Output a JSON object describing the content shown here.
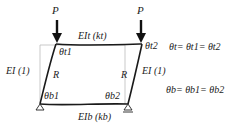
{
  "loads": {
    "left": "P",
    "right": "P"
  },
  "members": {
    "top_beam": "EIt (kt)",
    "bottom_beam": "EIb (kb)",
    "left_column": "EI (1)",
    "right_column": "EI (1)"
  },
  "rotation_labels": {
    "top_left": "θt1",
    "top_right": "θt2",
    "bottom_left": "θb1",
    "bottom_right": "θb2",
    "chord_left": "R",
    "chord_right": "R"
  },
  "equations": {
    "top": "θt= θt1= θt2",
    "bottom": "θb= θb1= θb2"
  },
  "colors": {
    "frame": "#1a1a1a",
    "undeformed": "#bbbbbb",
    "text": "#222222"
  }
}
